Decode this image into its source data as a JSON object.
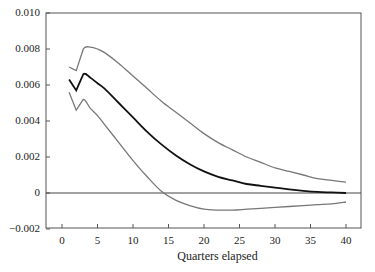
{
  "chart_data": {
    "type": "line",
    "title": "",
    "xlabel": "Quarters elapsed",
    "ylabel": "",
    "xlim": [
      -2,
      42
    ],
    "ylim": [
      -0.002,
      0.01
    ],
    "xticks": [
      0,
      5,
      10,
      15,
      20,
      25,
      30,
      35,
      40
    ],
    "xtick_labels": [
      "0",
      "5",
      "10",
      "15",
      "20",
      "25",
      "30",
      "35",
      "40"
    ],
    "yticks": [
      -0.002,
      0,
      0.002,
      0.004,
      0.006,
      0.008,
      0.01
    ],
    "ytick_labels": [
      "-0.002",
      "0",
      "0.002",
      "0.004",
      "0.006",
      "0.008",
      "0.010"
    ],
    "grid": false,
    "legend": null,
    "reference_line": {
      "y": 0
    },
    "x": [
      1,
      2,
      3,
      4,
      5,
      6,
      8,
      10,
      12,
      14,
      16,
      18,
      20,
      22,
      24,
      26,
      28,
      30,
      32,
      34,
      36,
      38,
      40
    ],
    "series": [
      {
        "name": "Upper band",
        "color": "#777777",
        "values": [
          0.007,
          0.0068,
          0.008,
          0.0081,
          0.008,
          0.0078,
          0.0072,
          0.0065,
          0.0058,
          0.0051,
          0.0045,
          0.0039,
          0.0033,
          0.0028,
          0.0024,
          0.002,
          0.0017,
          0.0014,
          0.0012,
          0.001,
          0.0008,
          0.0007,
          0.0006
        ]
      },
      {
        "name": "Point estimate",
        "color": "#111111",
        "values": [
          0.0063,
          0.0057,
          0.0066,
          0.0064,
          0.0061,
          0.0058,
          0.005,
          0.0042,
          0.0034,
          0.0027,
          0.0021,
          0.0016,
          0.0012,
          0.0009,
          0.0007,
          0.0005,
          0.0004,
          0.0003,
          0.0002,
          0.00012,
          6e-05,
          3e-05,
          0.0
        ]
      },
      {
        "name": "Lower band",
        "color": "#777777",
        "values": [
          0.0056,
          0.0046,
          0.0052,
          0.0047,
          0.0043,
          0.0038,
          0.0028,
          0.0018,
          0.0009,
          0.0001,
          -0.0004,
          -0.0007,
          -0.0009,
          -0.00095,
          -0.00095,
          -0.0009,
          -0.00085,
          -0.0008,
          -0.00075,
          -0.0007,
          -0.00065,
          -0.0006,
          -0.0005
        ]
      }
    ]
  }
}
